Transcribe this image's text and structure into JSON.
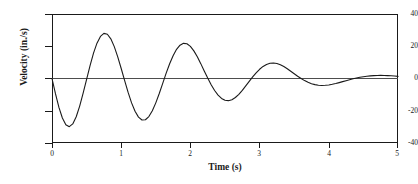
{
  "chart_data": {
    "type": "line",
    "title": "",
    "xlabel": "Time (s)",
    "ylabel": "Velocity (in./s)",
    "xlim": [
      0,
      5
    ],
    "ylim": [
      -40,
      40
    ],
    "xticks": [
      "0",
      "1",
      "2",
      "3",
      "4",
      "5"
    ],
    "xtick_values": [
      0,
      1,
      2,
      3,
      4,
      5
    ],
    "yticks": [
      "40",
      "20",
      "0",
      "-20",
      "-40"
    ],
    "ytick_values": [
      40,
      20,
      0,
      -20,
      -40
    ],
    "grid": false,
    "legend": false,
    "line_color": "#1a1a1a",
    "model": {
      "form": "v(t) = -A * exp(-k*t) * sin(2*pi*f*t)",
      "amplitude": 31.0,
      "decay_constant": 0.36,
      "frequency_hz": 1.0,
      "period_s": 1.0
    },
    "extrema": [
      {
        "t": 0.25,
        "v": -28.5,
        "kind": "minimum"
      },
      {
        "t": 0.74,
        "v": 24.5,
        "kind": "maximum"
      },
      {
        "t": 1.25,
        "v": -19.5,
        "kind": "minimum"
      },
      {
        "t": 1.74,
        "v": 17.0,
        "kind": "maximum"
      },
      {
        "t": 2.25,
        "v": -13.5,
        "kind": "minimum"
      },
      {
        "t": 2.74,
        "v": 11.5,
        "kind": "maximum"
      },
      {
        "t": 3.25,
        "v": -9.5,
        "kind": "minimum"
      },
      {
        "t": 3.74,
        "v": 8.0,
        "kind": "maximum"
      },
      {
        "t": 4.25,
        "v": -6.5,
        "kind": "minimum"
      },
      {
        "t": 4.78,
        "v": 4.5,
        "kind": "maximum"
      }
    ],
    "zero_crossings": [
      0.0,
      0.5,
      1.0,
      1.5,
      2.0,
      2.5,
      3.0,
      3.5,
      4.0,
      4.5,
      5.0
    ],
    "x": [
      0,
      0.05,
      0.1,
      0.15,
      0.2,
      0.25,
      0.3,
      0.35,
      0.4,
      0.45,
      0.5,
      0.55,
      0.6,
      0.65,
      0.7,
      0.75,
      0.8,
      0.85,
      0.9,
      0.95,
      1.0,
      1.05,
      1.1,
      1.15,
      1.2,
      1.25,
      1.3,
      1.35,
      1.4,
      1.45,
      1.5,
      1.55,
      1.6,
      1.65,
      1.7,
      1.75,
      1.8,
      1.85,
      1.9,
      1.95,
      2.0,
      2.05,
      2.1,
      2.15,
      2.2,
      2.25,
      2.3,
      2.35,
      2.4,
      2.45,
      2.5,
      2.55,
      2.6,
      2.65,
      2.7,
      2.75,
      2.8,
      2.85,
      2.9,
      2.95,
      3.0,
      3.05,
      3.1,
      3.15,
      3.2,
      3.25,
      3.3,
      3.35,
      3.4,
      3.45,
      3.5,
      3.55,
      3.6,
      3.65,
      3.7,
      3.75,
      3.8,
      3.85,
      3.9,
      3.95,
      4.0,
      4.05,
      4.1,
      4.15,
      4.2,
      4.25,
      4.3,
      4.35,
      4.4,
      4.45,
      4.5,
      4.55,
      4.6,
      4.65,
      4.7,
      4.75,
      4.8,
      4.85,
      4.9,
      4.95,
      5.0
    ],
    "y": [
      0.0,
      -9.44,
      -17.91,
      -24.52,
      -28.64,
      -29.87,
      -28.15,
      -23.72,
      -17.13,
      -9.12,
      -0.48,
      8.03,
      15.72,
      21.91,
      26.11,
      27.99,
      27.45,
      24.61,
      19.78,
      13.44,
      6.19,
      -1.35,
      -8.64,
      -15.12,
      -20.34,
      -23.94,
      -25.71,
      -25.57,
      -23.6,
      -20.0,
      -15.1,
      -9.27,
      -2.98,
      3.3,
      9.14,
      14.16,
      18.07,
      20.65,
      21.8,
      21.52,
      19.9,
      17.13,
      13.47,
      9.22,
      4.71,
      0.27,
      -3.85,
      -7.43,
      -10.31,
      -12.35,
      -13.5,
      -13.75,
      -13.15,
      -11.79,
      -9.8,
      -7.35,
      -4.62,
      -1.79,
      0.97,
      3.52,
      5.72,
      7.48,
      8.72,
      9.42,
      9.59,
      9.26,
      8.5,
      7.39,
      6.03,
      4.51,
      2.94,
      1.4,
      -0.03,
      -1.3,
      -2.37,
      -3.21,
      -3.81,
      -4.17,
      -4.3,
      -4.23,
      -3.99,
      -3.6,
      -3.11,
      -2.55,
      -1.95,
      -1.34,
      -0.75,
      -0.19,
      0.31,
      0.75,
      1.12,
      1.42,
      1.65,
      1.8,
      1.89,
      1.92,
      1.89,
      1.81,
      1.69,
      1.53,
      1.34
    ]
  }
}
